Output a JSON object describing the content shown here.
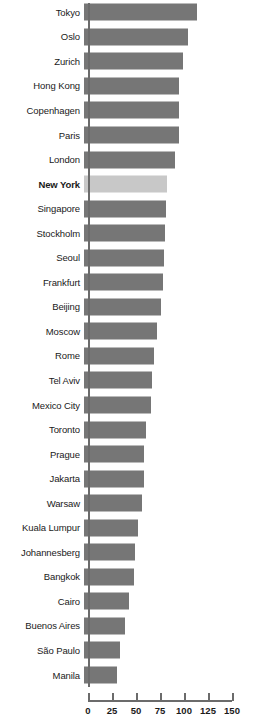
{
  "chart_data": {
    "type": "bar",
    "orientation": "horizontal",
    "title": "",
    "subtitle": "",
    "xlabel": "",
    "ylabel": "",
    "xlim": [
      0,
      150
    ],
    "xticks": [
      0,
      25,
      50,
      75,
      100,
      125,
      150
    ],
    "xtick_labels": [
      "0",
      "25",
      "50",
      "75",
      "100",
      "125",
      "150"
    ],
    "grid": false,
    "legend": false,
    "bar_color": "#767676",
    "highlight_color": "#c8c8c8",
    "highlight_category": "New York",
    "axis_color": "#6b6b6b",
    "categories": [
      "Tokyo",
      "Oslo",
      "Zurich",
      "Hong Kong",
      "Copenhagen",
      "Paris",
      "London",
      "New York",
      "Singapore",
      "Stockholm",
      "Seoul",
      "Frankfurt",
      "Beijing",
      "Moscow",
      "Rome",
      "Tel Aviv",
      "Mexico City",
      "Toronto",
      "Prague",
      "Jakarta",
      "Warsaw",
      "Kuala Lumpur",
      "Johannesberg",
      "Bangkok",
      "Cairo",
      "Buenos Aires",
      "São Paulo",
      "Manila"
    ],
    "values": [
      118,
      108,
      103,
      99,
      99,
      99,
      95,
      86,
      85,
      84,
      83,
      82,
      80,
      76,
      73,
      71,
      70,
      65,
      63,
      63,
      60,
      56,
      53,
      52,
      47,
      43,
      37,
      34
    ],
    "bars": [
      {
        "label": "Tokyo",
        "value": 118,
        "highlight": false
      },
      {
        "label": "Oslo",
        "value": 108,
        "highlight": false
      },
      {
        "label": "Zurich",
        "value": 103,
        "highlight": false
      },
      {
        "label": "Hong Kong",
        "value": 99,
        "highlight": false
      },
      {
        "label": "Copenhagen",
        "value": 99,
        "highlight": false
      },
      {
        "label": "Paris",
        "value": 99,
        "highlight": false
      },
      {
        "label": "London",
        "value": 95,
        "highlight": false
      },
      {
        "label": "New York",
        "value": 86,
        "highlight": true
      },
      {
        "label": "Singapore",
        "value": 85,
        "highlight": false
      },
      {
        "label": "Stockholm",
        "value": 84,
        "highlight": false
      },
      {
        "label": "Seoul",
        "value": 83,
        "highlight": false
      },
      {
        "label": "Frankfurt",
        "value": 82,
        "highlight": false
      },
      {
        "label": "Beijing",
        "value": 80,
        "highlight": false
      },
      {
        "label": "Moscow",
        "value": 76,
        "highlight": false
      },
      {
        "label": "Rome",
        "value": 73,
        "highlight": false
      },
      {
        "label": "Tel Aviv",
        "value": 71,
        "highlight": false
      },
      {
        "label": "Mexico City",
        "value": 70,
        "highlight": false
      },
      {
        "label": "Toronto",
        "value": 65,
        "highlight": false
      },
      {
        "label": "Prague",
        "value": 63,
        "highlight": false
      },
      {
        "label": "Jakarta",
        "value": 63,
        "highlight": false
      },
      {
        "label": "Warsaw",
        "value": 60,
        "highlight": false
      },
      {
        "label": "Kuala Lumpur",
        "value": 56,
        "highlight": false
      },
      {
        "label": "Johannesberg",
        "value": 53,
        "highlight": false
      },
      {
        "label": "Bangkok",
        "value": 52,
        "highlight": false
      },
      {
        "label": "Cairo",
        "value": 47,
        "highlight": false
      },
      {
        "label": "Buenos Aires",
        "value": 43,
        "highlight": false
      },
      {
        "label": "São Paulo",
        "value": 37,
        "highlight": false
      },
      {
        "label": "Manila",
        "value": 34,
        "highlight": false
      }
    ]
  }
}
